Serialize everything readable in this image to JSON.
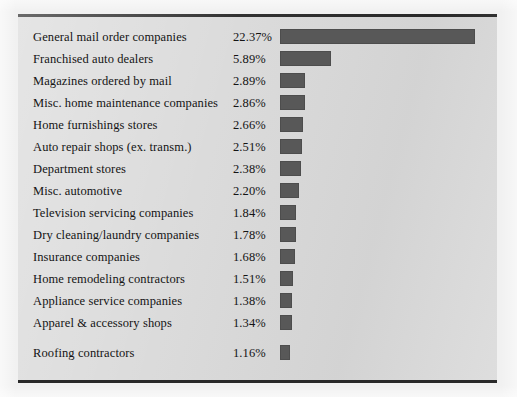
{
  "chart_data": {
    "type": "bar",
    "orientation": "horizontal",
    "title": "",
    "subtitle": "",
    "xlabel": "",
    "ylabel": "",
    "grid": false,
    "legend": null,
    "value_suffix": "%",
    "xlim": [
      0,
      22.37
    ],
    "categories": [
      "General mail order companies",
      "Franchised auto dealers",
      "Magazines ordered by mail",
      "Misc. home maintenance companies",
      "Home furnishings stores",
      "Auto repair shops (ex. transm.)",
      "Department stores",
      "Misc. automotive",
      "Television servicing companies",
      "Dry cleaning/laundry companies",
      "Insurance companies",
      "Home remodeling contractors",
      "Appliance service companies",
      "Apparel & accessory shops",
      "Roofing contractors"
    ],
    "values": [
      22.37,
      5.89,
      2.89,
      2.86,
      2.66,
      2.51,
      2.38,
      2.2,
      1.84,
      1.78,
      1.68,
      1.51,
      1.38,
      1.34,
      1.16
    ],
    "value_labels": [
      "22.37%",
      "5.89%",
      "2.89%",
      "2.86%",
      "2.66%",
      "2.51%",
      "2.38%",
      "2.20%",
      "1.84%",
      "1.78%",
      "1.68%",
      "1.51%",
      "1.38%",
      "1.34%",
      "1.16%"
    ]
  },
  "colors": {
    "bar_fill": "#585858",
    "bar_stroke": "#4d4d4d",
    "panel_background": "#dadada",
    "page_background": "#f1f1f1",
    "rule": "#2a2a2a",
    "text": "#141414"
  },
  "scale": {
    "pixels_per_percent": 8.72,
    "bar_area_width_px": 205
  }
}
